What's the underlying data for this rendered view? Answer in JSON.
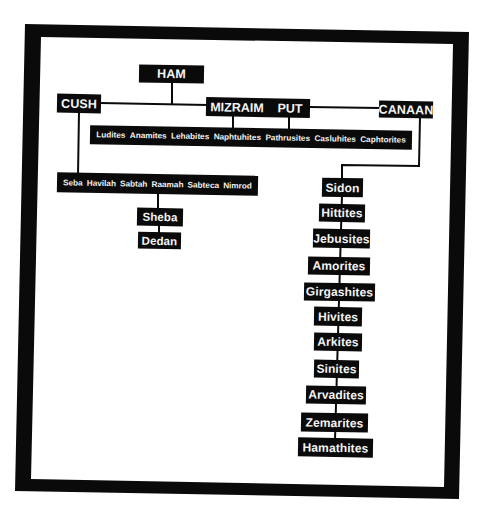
{
  "diagram": {
    "type": "family-tree",
    "root": {
      "label": "HAM"
    },
    "sons": [
      {
        "label": "CUSH"
      },
      {
        "label": "MIZRAIM"
      },
      {
        "label": "PUT"
      },
      {
        "label": "CANAAN"
      }
    ],
    "cush_children": {
      "items": [
        {
          "label": "Seba"
        },
        {
          "label": "Havilah"
        },
        {
          "label": "Sabtah"
        },
        {
          "label": "Raamah"
        },
        {
          "label": "Sabteca"
        },
        {
          "label": "Nimrod"
        }
      ]
    },
    "raamah_children": [
      {
        "label": "Sheba"
      },
      {
        "label": "Dedan"
      }
    ],
    "mizraim_children": {
      "items": [
        {
          "label": "Ludites"
        },
        {
          "label": "Anamites"
        },
        {
          "label": "Lehabites"
        },
        {
          "label": "Naphtuhites"
        },
        {
          "label": "Pathrusites"
        },
        {
          "label": "Casluhites"
        },
        {
          "label": "Caphtorites"
        }
      ]
    },
    "canaan_children": [
      {
        "label": "Sidon"
      },
      {
        "label": "Hittites"
      },
      {
        "label": "Jebusites"
      },
      {
        "label": "Amorites"
      },
      {
        "label": "Girgashites"
      },
      {
        "label": "Hivites"
      },
      {
        "label": "Arkites"
      },
      {
        "label": "Sinites"
      },
      {
        "label": "Arvadites"
      },
      {
        "label": "Zemarites"
      },
      {
        "label": "Hamathites"
      }
    ]
  },
  "colors": {
    "node_fill": "#0a0a0a",
    "node_text": "#f4f4f4",
    "frame": "#0a0a0a",
    "background": "#ffffff",
    "connector": "#0a0a0a"
  }
}
